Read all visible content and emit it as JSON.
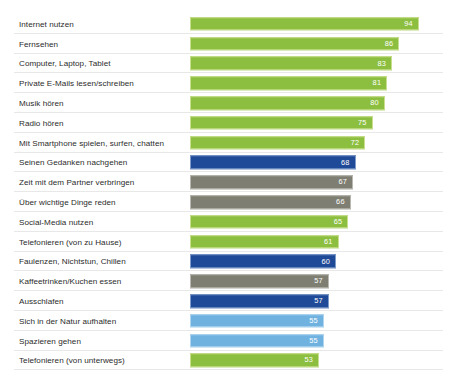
{
  "page": {
    "cutoff_top_text": "",
    "background": "#ffffff"
  },
  "colors": {
    "green": "#8CBE3F",
    "dark_blue": "#1F4A97",
    "gray": "#7E7E72",
    "light_blue": "#6FB2E0",
    "row_separator": "#e8e8e8",
    "label_text": "#2b2b2b",
    "value_text": "#ffffff"
  },
  "chart_data": {
    "type": "bar",
    "orientation": "horizontal",
    "title": "",
    "subtitle": "",
    "xlabel": "",
    "ylabel": "",
    "xlim": [
      0,
      100
    ],
    "grid": false,
    "legend": "none",
    "value_labels_inside": true,
    "categories": [
      "Internet nutzen",
      "Fernsehen",
      "Computer, Laptop, Tablet",
      "Private E-Mails lesen/schreiben",
      "Musik hören",
      "Radio hören",
      "Mit Smartphone spielen, surfen, chatten",
      "Seinen Gedanken nachgehen",
      "Zeit mit dem Partner verbringen",
      "Über wichtige Dinge reden",
      "Social-Media nutzen",
      "Telefonieren (von zu Hause)",
      "Faulenzen, Nichtstun, Chillen",
      "Kaffeetrinken/Kuchen essen",
      "Ausschlafen",
      "Sich in der Natur aufhalten",
      "Spazieren gehen",
      "Telefonieren (von unterwegs)"
    ],
    "values": [
      94,
      86,
      83,
      81,
      80,
      75,
      72,
      68,
      67,
      66,
      65,
      61,
      60,
      57,
      57,
      55,
      55,
      53
    ],
    "bar_colors": [
      "green",
      "green",
      "green",
      "green",
      "green",
      "green",
      "green",
      "dark_blue",
      "gray",
      "gray",
      "green",
      "green",
      "dark_blue",
      "gray",
      "dark_blue",
      "light_blue",
      "light_blue",
      "green"
    ]
  }
}
